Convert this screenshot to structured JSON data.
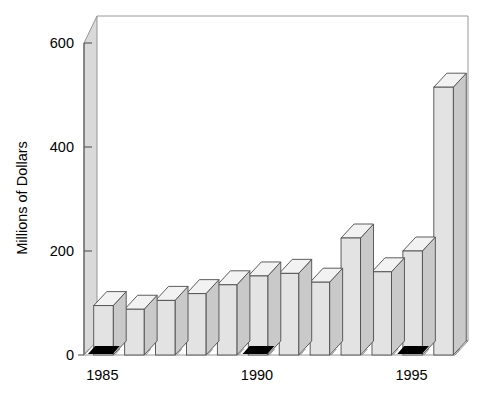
{
  "chart_data": {
    "type": "bar",
    "title": "",
    "subtitle": "",
    "xlabel": "",
    "ylabel": "Millions of Dollars",
    "categories": [
      "1985",
      "1986",
      "1987",
      "1988",
      "1989",
      "1990",
      "1991",
      "1992",
      "1993",
      "1994",
      "1995",
      "1996"
    ],
    "values": [
      95,
      88,
      105,
      118,
      135,
      152,
      157,
      140,
      225,
      160,
      200,
      515
    ],
    "ylim": [
      0,
      640
    ],
    "ytick_values": [
      0,
      200,
      400,
      600
    ],
    "ytick_labels": [
      "0",
      "200",
      "400",
      "600"
    ],
    "xtick_labels_shown": [
      "1985",
      "1990",
      "1995"
    ],
    "xtick_label_positions": [
      0,
      5,
      10
    ],
    "grid": false,
    "legend": null,
    "style": "3d-bar",
    "bar_face_color": "#e3e3e3",
    "bar_top_color": "#f2f2f2",
    "bar_side_color": "#c9c9c9",
    "bar_edge_color": "#4d4d4d",
    "wall_color": "#d9d9d9",
    "axis_color": "#555555",
    "marker_color": "#000000",
    "background_color": "#ffffff"
  },
  "axis": {
    "y_label": "Millions of Dollars",
    "y_ticks": [
      "600",
      "400",
      "200",
      "0"
    ],
    "x_labels": [
      "1985",
      "1990",
      "1995"
    ]
  }
}
